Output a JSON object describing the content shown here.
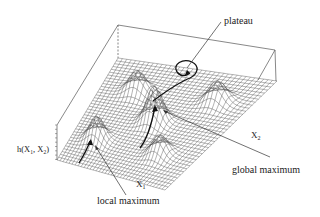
{
  "figure": {
    "type": "3d-fitness-landscape",
    "axes": {
      "x1_label": "X",
      "x1_sub": "1",
      "x2_label": "X",
      "x2_sub": "2",
      "z_label": "h(X",
      "z_sub1": "1",
      "z_mid": ", X",
      "z_sub2": "2",
      "z_close": ")"
    },
    "annotations": {
      "plateau": "plateau",
      "global_maximum": "global maximum",
      "local_maximum": "local maximum"
    },
    "peaks": [
      {
        "name": "back-left",
        "u": 0.28,
        "v": 0.25,
        "height": 0.55
      },
      {
        "name": "center-global",
        "u": 0.5,
        "v": 0.5,
        "height": 0.9
      },
      {
        "name": "right",
        "u": 0.25,
        "v": 0.78,
        "height": 0.55
      },
      {
        "name": "front-local",
        "u": 0.75,
        "v": 0.2,
        "height": 0.6
      },
      {
        "name": "front-right",
        "u": 0.75,
        "v": 0.72,
        "height": 0.5
      }
    ],
    "grid_resolution": 36,
    "colors": {
      "mesh": "#555555",
      "path": "#111111",
      "text": "#222222"
    }
  }
}
